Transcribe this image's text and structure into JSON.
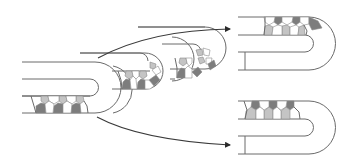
{
  "figure": {
    "colors": {
      "background": "#ffffff",
      "outline": "#6a6a6a",
      "arrow": "#3a3a3a",
      "cell_dark": "#7d7d7d",
      "cell_light": "#c4c4c4",
      "cell_white": "#ffffff"
    },
    "structures": [
      {
        "id": "stage-1",
        "position": "left",
        "cell_layer": "bottom"
      },
      {
        "id": "stage-2",
        "position": "center-left",
        "cell_layer": "bottom-and-bend"
      },
      {
        "id": "stage-3",
        "position": "center",
        "cell_layer": "bottom-and-bend"
      },
      {
        "id": "outcome-a",
        "position": "top-right",
        "cell_layer": "top"
      },
      {
        "id": "outcome-b",
        "position": "bottom-right",
        "cell_layer": "top"
      }
    ],
    "arrows": [
      {
        "from": "stage-1",
        "to": "outcome-a",
        "direction": "up-right"
      },
      {
        "from": "stage-1",
        "to": "outcome-b",
        "direction": "down-right"
      }
    ]
  }
}
